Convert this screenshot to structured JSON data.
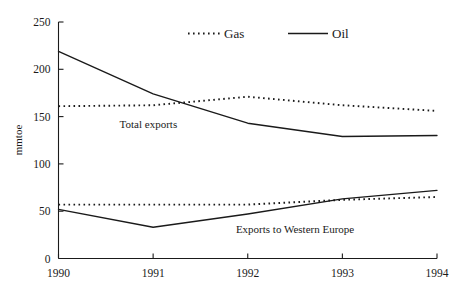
{
  "chart_data": {
    "type": "line",
    "title": "",
    "subtitle": "",
    "xlabel": "",
    "ylabel": "mmtoe",
    "x": [
      1990,
      1991,
      1992,
      1993,
      1994
    ],
    "categories": [
      "1990",
      "1991",
      "1992",
      "1993",
      "1994"
    ],
    "xtick_labels": [
      "1990",
      "1991",
      "1992",
      "1993",
      "1994"
    ],
    "ytick_labels": [
      "250",
      "200",
      "150",
      "100",
      "50",
      "0"
    ],
    "yticks": [
      250,
      200,
      150,
      100,
      50,
      0
    ],
    "ylim": [
      0,
      250
    ],
    "xlim": [
      1990,
      1994
    ],
    "grid": false,
    "legend_position": "top-center",
    "legend": [
      {
        "name": "Gas",
        "style": "dotted"
      },
      {
        "name": "Oil",
        "style": "solid"
      }
    ],
    "annotations": [
      {
        "text": "Total exports",
        "x": 1990.95,
        "y": 138
      },
      {
        "text": "Exports to Western Europe",
        "x": 1992.5,
        "y": 27
      }
    ],
    "series": [
      {
        "name": "Gas",
        "group": "Total exports",
        "style": "dotted",
        "values": [
          161,
          162,
          171,
          162,
          156
        ]
      },
      {
        "name": "Oil",
        "group": "Total exports",
        "style": "solid",
        "values": [
          219,
          174,
          143,
          129,
          130
        ]
      },
      {
        "name": "Gas",
        "group": "Exports to Western Europe",
        "style": "dotted",
        "values": [
          57,
          57,
          57,
          62,
          65
        ]
      },
      {
        "name": "Oil",
        "group": "Exports to Western Europe",
        "style": "solid",
        "values": [
          52,
          33,
          47,
          63,
          72
        ]
      }
    ]
  }
}
